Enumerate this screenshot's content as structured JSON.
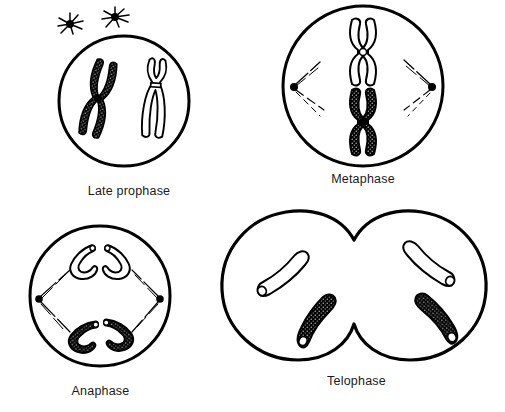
{
  "figure": {
    "background_color": "#ffffff",
    "ink_color": "#000000"
  },
  "stages": [
    {
      "id": "late-prophase",
      "label": "Late prophase",
      "cell_shape": "single-circle",
      "centrosomes_outside": 2,
      "chromosomes": [
        {
          "style": "dark-stippled",
          "shape": "X-chromosome-tilted"
        },
        {
          "style": "outline",
          "shape": "X-chromosome-upright"
        }
      ],
      "spindle_fibers": "aster-rays-only"
    },
    {
      "id": "metaphase",
      "label": "Metaphase",
      "cell_shape": "single-circle",
      "centrioles": 2,
      "centriole_positions": [
        "left",
        "right"
      ],
      "chromosomes": [
        {
          "style": "outline",
          "shape": "X-chromosome-upright"
        },
        {
          "style": "dark-stippled",
          "shape": "X-chromosome-upright"
        }
      ],
      "spindle_fibers": "dashed-rays-both-poles",
      "alignment": "metaphase-plate-center"
    },
    {
      "id": "anaphase",
      "label": "Anaphase",
      "cell_shape": "single-circle",
      "centrioles": 2,
      "centriole_positions": [
        "left",
        "right"
      ],
      "chromosomes": [
        {
          "style": "outline",
          "shape": "V-chromatid"
        },
        {
          "style": "outline",
          "shape": "V-chromatid"
        },
        {
          "style": "dark-stippled",
          "shape": "V-chromatid"
        },
        {
          "style": "dark-stippled",
          "shape": "V-chromatid"
        }
      ],
      "spindle_fibers": "dashed-rays-both-poles"
    },
    {
      "id": "telophase",
      "label": "Telophase",
      "cell_shape": "two-daughter-cells-with-cleavage-furrow",
      "daughter_cells": 2,
      "chromosomes": [
        {
          "style": "outline",
          "shape": "elongated-decondensing",
          "cell": "left"
        },
        {
          "style": "dark-stippled",
          "shape": "elongated-decondensing",
          "cell": "left"
        },
        {
          "style": "outline",
          "shape": "elongated-decondensing",
          "cell": "right"
        },
        {
          "style": "dark-stippled",
          "shape": "elongated-decondensing",
          "cell": "right"
        }
      ],
      "spindle_fibers": "none"
    }
  ]
}
